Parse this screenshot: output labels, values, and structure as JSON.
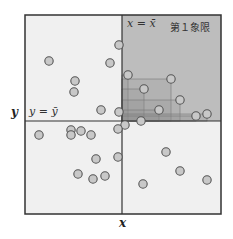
{
  "labels": {
    "x_axis": "x",
    "y_axis": "y",
    "x_mean_line": "x = x̄",
    "y_mean_line": "y = ȳ",
    "quadrant_label": "第１象限"
  },
  "colors": {
    "background": "#f0f0f0",
    "quadrant1": "#bdbdbd",
    "rect_fill": "#8c8c8c",
    "point_fill": "#c8c8c8",
    "point_stroke": "#555555",
    "frame": "#333333"
  },
  "frame": {
    "left": 25,
    "top": 15,
    "right": 221,
    "bottom": 214
  },
  "mean": {
    "x": 122,
    "y": 121
  },
  "points": [
    [
      119,
      45
    ],
    [
      49,
      61
    ],
    [
      110,
      63
    ],
    [
      128,
      75
    ],
    [
      171,
      79
    ],
    [
      75,
      81
    ],
    [
      144,
      89
    ],
    [
      74,
      92
    ],
    [
      180,
      100
    ],
    [
      159,
      110
    ],
    [
      101,
      110
    ],
    [
      119,
      112
    ],
    [
      207,
      114
    ],
    [
      196,
      116
    ],
    [
      141,
      121
    ],
    [
      125,
      125
    ],
    [
      39,
      135
    ],
    [
      71,
      130
    ],
    [
      71,
      135
    ],
    [
      81,
      131
    ],
    [
      91,
      135
    ],
    [
      118,
      129
    ],
    [
      166,
      152
    ],
    [
      96,
      159
    ],
    [
      118,
      157
    ],
    [
      180,
      171
    ],
    [
      78,
      174
    ],
    [
      93,
      179
    ],
    [
      105,
      176
    ],
    [
      143,
      184
    ],
    [
      207,
      180
    ]
  ],
  "highlight_points": [
    [
      128,
      75
    ],
    [
      171,
      79
    ],
    [
      144,
      89
    ],
    [
      180,
      100
    ],
    [
      159,
      110
    ],
    [
      207,
      114
    ],
    [
      196,
      116
    ]
  ]
}
